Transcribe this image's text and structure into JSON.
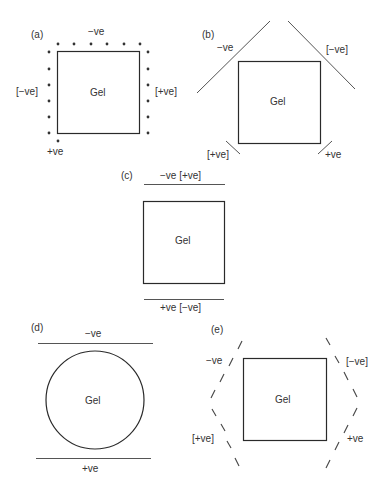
{
  "figure": {
    "gel_label": "Gel",
    "panels": [
      {
        "id": "a",
        "label": "(a)",
        "gel_shape": "square",
        "electrode_type": "point-electrode-array",
        "texts": {
          "top": "−ve",
          "left": "[−ve]",
          "right": "[+ve]",
          "bottom": "+ve"
        }
      },
      {
        "id": "b",
        "label": "(b)",
        "gel_shape": "square",
        "electrode_type": "angled-line-electrodes",
        "texts": {
          "top_left": "−ve",
          "top_right": "[−ve]",
          "bottom_left": "[+ve]",
          "bottom_right": "+ve"
        }
      },
      {
        "id": "c",
        "label": "(c)",
        "gel_shape": "square",
        "electrode_type": "parallel-line-electrodes",
        "texts": {
          "top": "−ve [+ve]",
          "bottom": "+ve [−ve]"
        }
      },
      {
        "id": "d",
        "label": "(d)",
        "gel_shape": "circle",
        "electrode_type": "parallel-line-electrodes",
        "texts": {
          "top": "−ve",
          "bottom": "+ve"
        }
      },
      {
        "id": "e",
        "label": "(e)",
        "gel_shape": "square",
        "electrode_type": "hexagonal-dashed-electrodes",
        "texts": {
          "top_left": "−ve",
          "top_right": "[−ve]",
          "bottom_left": "[+ve]",
          "bottom_right": "+ve"
        }
      }
    ]
  }
}
